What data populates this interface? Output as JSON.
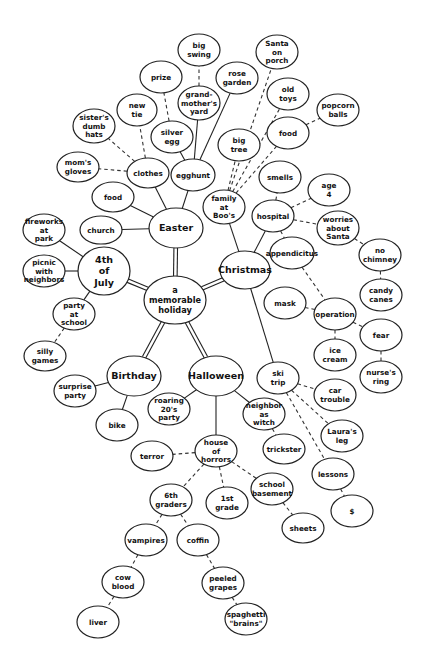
{
  "diagram": {
    "type": "mind map / cluster diagram",
    "central_topic": "a memorable holiday",
    "nodes": [
      {
        "id": "center",
        "label": [
          "a",
          "memorable",
          "holiday"
        ],
        "x": 175,
        "y": 300,
        "rx": 31,
        "ry": 24,
        "kind": "center"
      },
      {
        "id": "easter",
        "label": [
          "Easter"
        ],
        "x": 176,
        "y": 228,
        "rx": 27,
        "ry": 20,
        "kind": "major"
      },
      {
        "id": "christmas",
        "label": [
          "Christmas"
        ],
        "x": 245,
        "y": 270,
        "rx": 25,
        "ry": 19,
        "kind": "major"
      },
      {
        "id": "july4",
        "label": [
          "4th",
          "of",
          "July"
        ],
        "x": 104,
        "y": 271,
        "rx": 26,
        "ry": 24,
        "kind": "major"
      },
      {
        "id": "birthday",
        "label": [
          "Birthday"
        ],
        "x": 134,
        "y": 376,
        "rx": 27,
        "ry": 20,
        "kind": "major"
      },
      {
        "id": "halloween",
        "label": [
          "Halloween"
        ],
        "x": 216,
        "y": 376,
        "rx": 27,
        "ry": 20,
        "kind": "major"
      },
      {
        "id": "church",
        "label": [
          "church"
        ],
        "x": 101,
        "y": 230,
        "rx": 21,
        "ry": 14
      },
      {
        "id": "food_e",
        "label": [
          "food"
        ],
        "x": 113,
        "y": 197,
        "rx": 21,
        "ry": 15
      },
      {
        "id": "clothes",
        "label": [
          "clothes"
        ],
        "x": 148,
        "y": 173,
        "rx": 21,
        "ry": 15
      },
      {
        "id": "egghunt",
        "label": [
          "egghunt"
        ],
        "x": 193,
        "y": 175,
        "rx": 22,
        "ry": 16
      },
      {
        "id": "moms_gloves",
        "label": [
          "mom's",
          "gloves"
        ],
        "x": 78,
        "y": 167,
        "rx": 21,
        "ry": 15
      },
      {
        "id": "sisters_hats",
        "label": [
          "sister's",
          "dumb",
          "hats"
        ],
        "x": 94,
        "y": 126,
        "rx": 21,
        "ry": 17
      },
      {
        "id": "new_tie",
        "label": [
          "new",
          "tie"
        ],
        "x": 137,
        "y": 110,
        "rx": 20,
        "ry": 16
      },
      {
        "id": "prize",
        "label": [
          "prize"
        ],
        "x": 161,
        "y": 77,
        "rx": 21,
        "ry": 16
      },
      {
        "id": "silver_egg",
        "label": [
          "silver",
          "egg"
        ],
        "x": 172,
        "y": 137,
        "rx": 21,
        "ry": 16
      },
      {
        "id": "grandmothers_yard",
        "label": [
          "grand-",
          "mother's",
          "yard"
        ],
        "x": 199,
        "y": 103,
        "rx": 21,
        "ry": 17
      },
      {
        "id": "big_swing",
        "label": [
          "big",
          "swing"
        ],
        "x": 199,
        "y": 50,
        "rx": 21,
        "ry": 16
      },
      {
        "id": "rose_garden",
        "label": [
          "rose",
          "garden"
        ],
        "x": 237,
        "y": 78,
        "rx": 21,
        "ry": 16
      },
      {
        "id": "fireworks",
        "label": [
          "fireworks",
          "at",
          "park"
        ],
        "x": 44,
        "y": 230,
        "rx": 21,
        "ry": 16
      },
      {
        "id": "picnic",
        "label": [
          "picnic",
          "with",
          "neighbors"
        ],
        "x": 44,
        "y": 271,
        "rx": 21,
        "ry": 16
      },
      {
        "id": "party_school",
        "label": [
          "party",
          "at",
          "school"
        ],
        "x": 74,
        "y": 314,
        "rx": 21,
        "ry": 16
      },
      {
        "id": "silly_games",
        "label": [
          "silly",
          "games"
        ],
        "x": 45,
        "y": 356,
        "rx": 21,
        "ry": 15
      },
      {
        "id": "surprise_party",
        "label": [
          "surprise",
          "party"
        ],
        "x": 75,
        "y": 391,
        "rx": 21,
        "ry": 16
      },
      {
        "id": "bike",
        "label": [
          "bike"
        ],
        "x": 117,
        "y": 425,
        "rx": 21,
        "ry": 16
      },
      {
        "id": "roaring20s",
        "label": [
          "roaring",
          "20's",
          "party"
        ],
        "x": 169,
        "y": 409,
        "rx": 21,
        "ry": 16
      },
      {
        "id": "neighbor_witch",
        "label": [
          "neighbor",
          "as",
          "witch"
        ],
        "x": 264,
        "y": 414,
        "rx": 21,
        "ry": 16
      },
      {
        "id": "trickster",
        "label": [
          "trickster"
        ],
        "x": 284,
        "y": 449,
        "rx": 21,
        "ry": 15
      },
      {
        "id": "house_horrors",
        "label": [
          "house",
          "of",
          "horrors"
        ],
        "x": 216,
        "y": 451,
        "rx": 21,
        "ry": 16
      },
      {
        "id": "terror",
        "label": [
          "terror"
        ],
        "x": 152,
        "y": 456,
        "rx": 21,
        "ry": 15
      },
      {
        "id": "school_basement",
        "label": [
          "school",
          "basement"
        ],
        "x": 272,
        "y": 489,
        "rx": 21,
        "ry": 16
      },
      {
        "id": "sheets",
        "label": [
          "sheets"
        ],
        "x": 303,
        "y": 528,
        "rx": 21,
        "ry": 15
      },
      {
        "id": "first_grade",
        "label": [
          "1st",
          "grade"
        ],
        "x": 227,
        "y": 503,
        "rx": 21,
        "ry": 16
      },
      {
        "id": "sixth_graders",
        "label": [
          "6th",
          "graders"
        ],
        "x": 171,
        "y": 500,
        "rx": 21,
        "ry": 16
      },
      {
        "id": "vampires",
        "label": [
          "vampires"
        ],
        "x": 146,
        "y": 540,
        "rx": 21,
        "ry": 16
      },
      {
        "id": "coffin",
        "label": [
          "coffin"
        ],
        "x": 198,
        "y": 540,
        "rx": 21,
        "ry": 16
      },
      {
        "id": "cow_blood",
        "label": [
          "cow",
          "blood"
        ],
        "x": 123,
        "y": 582,
        "rx": 21,
        "ry": 16
      },
      {
        "id": "peeled_grapes",
        "label": [
          "peeled",
          "grapes"
        ],
        "x": 223,
        "y": 583,
        "rx": 21,
        "ry": 16
      },
      {
        "id": "liver",
        "label": [
          "liver"
        ],
        "x": 98,
        "y": 622,
        "rx": 21,
        "ry": 16
      },
      {
        "id": "spaghetti_brains",
        "label": [
          "spaghetti",
          "\"brains\""
        ],
        "x": 246,
        "y": 619,
        "rx": 21,
        "ry": 16
      },
      {
        "id": "family_boos",
        "label": [
          "family",
          "at",
          "Boo's"
        ],
        "x": 224,
        "y": 207,
        "rx": 21,
        "ry": 17
      },
      {
        "id": "big_tree",
        "label": [
          "big",
          "tree"
        ],
        "x": 239,
        "y": 145,
        "rx": 21,
        "ry": 16
      },
      {
        "id": "santa_porch",
        "label": [
          "Santa",
          "on",
          "porch"
        ],
        "x": 277,
        "y": 52,
        "rx": 21,
        "ry": 17
      },
      {
        "id": "old_toys",
        "label": [
          "old",
          "toys"
        ],
        "x": 288,
        "y": 94,
        "rx": 21,
        "ry": 16
      },
      {
        "id": "food_c",
        "label": [
          "food"
        ],
        "x": 288,
        "y": 133,
        "rx": 21,
        "ry": 16
      },
      {
        "id": "popcorn_balls",
        "label": [
          "popcorn",
          "balls"
        ],
        "x": 338,
        "y": 110,
        "rx": 21,
        "ry": 16
      },
      {
        "id": "smells",
        "label": [
          "smells"
        ],
        "x": 280,
        "y": 177,
        "rx": 21,
        "ry": 16
      },
      {
        "id": "hospital",
        "label": [
          "hospital"
        ],
        "x": 273,
        "y": 216,
        "rx": 21,
        "ry": 16
      },
      {
        "id": "age4",
        "label": [
          "age",
          "4"
        ],
        "x": 329,
        "y": 190,
        "rx": 21,
        "ry": 16
      },
      {
        "id": "worries_santa",
        "label": [
          "worries",
          "about",
          "Santa"
        ],
        "x": 338,
        "y": 228,
        "rx": 21,
        "ry": 17
      },
      {
        "id": "appendicitus",
        "label": [
          "appendicitus"
        ],
        "x": 292,
        "y": 253,
        "rx": 22,
        "ry": 16
      },
      {
        "id": "no_chimney",
        "label": [
          "no",
          "chimney"
        ],
        "x": 380,
        "y": 255,
        "rx": 21,
        "ry": 16
      },
      {
        "id": "candy_canes",
        "label": [
          "candy",
          "canes"
        ],
        "x": 381,
        "y": 295,
        "rx": 21,
        "ry": 16
      },
      {
        "id": "mask",
        "label": [
          "mask"
        ],
        "x": 285,
        "y": 303,
        "rx": 21,
        "ry": 16
      },
      {
        "id": "operation",
        "label": [
          "operation"
        ],
        "x": 335,
        "y": 314,
        "rx": 21,
        "ry": 16
      },
      {
        "id": "fear",
        "label": [
          "fear"
        ],
        "x": 381,
        "y": 335,
        "rx": 21,
        "ry": 16
      },
      {
        "id": "ice_cream",
        "label": [
          "ice",
          "cream"
        ],
        "x": 335,
        "y": 355,
        "rx": 21,
        "ry": 16
      },
      {
        "id": "nurses_ring",
        "label": [
          "nurse's",
          "ring"
        ],
        "x": 381,
        "y": 377,
        "rx": 21,
        "ry": 16
      },
      {
        "id": "ski_trip",
        "label": [
          "ski",
          "trip"
        ],
        "x": 278,
        "y": 378,
        "rx": 21,
        "ry": 16
      },
      {
        "id": "car_trouble",
        "label": [
          "car",
          "trouble"
        ],
        "x": 335,
        "y": 395,
        "rx": 21,
        "ry": 16
      },
      {
        "id": "lauras_leg",
        "label": [
          "Laura's",
          "leg"
        ],
        "x": 342,
        "y": 436,
        "rx": 21,
        "ry": 16
      },
      {
        "id": "lessons",
        "label": [
          "lessons"
        ],
        "x": 333,
        "y": 474,
        "rx": 21,
        "ry": 16
      },
      {
        "id": "dollar",
        "label": [
          "$"
        ],
        "x": 352,
        "y": 511,
        "rx": 21,
        "ry": 16
      }
    ],
    "edges": [
      {
        "from": "center",
        "to": "easter",
        "style": "double"
      },
      {
        "from": "center",
        "to": "christmas",
        "style": "double"
      },
      {
        "from": "center",
        "to": "july4",
        "style": "double"
      },
      {
        "from": "center",
        "to": "birthday",
        "style": "double"
      },
      {
        "from": "center",
        "to": "halloween",
        "style": "double"
      },
      {
        "from": "easter",
        "to": "church",
        "style": "solid"
      },
      {
        "from": "easter",
        "to": "food_e",
        "style": "solid"
      },
      {
        "from": "easter",
        "to": "clothes",
        "style": "solid"
      },
      {
        "from": "easter",
        "to": "egghunt",
        "style": "solid"
      },
      {
        "from": "clothes",
        "to": "moms_gloves",
        "style": "dashed"
      },
      {
        "from": "clothes",
        "to": "sisters_hats",
        "style": "dashed"
      },
      {
        "from": "clothes",
        "to": "new_tie",
        "style": "dashed"
      },
      {
        "from": "egghunt",
        "to": "silver_egg",
        "style": "solid"
      },
      {
        "from": "silver_egg",
        "to": "prize",
        "style": "dashed"
      },
      {
        "from": "egghunt",
        "to": "grandmothers_yard",
        "style": "solid"
      },
      {
        "from": "grandmothers_yard",
        "to": "big_swing",
        "style": "dashed"
      },
      {
        "from": "egghunt",
        "to": "rose_garden",
        "style": "solid"
      },
      {
        "from": "july4",
        "to": "fireworks",
        "style": "solid"
      },
      {
        "from": "july4",
        "to": "picnic",
        "style": "solid"
      },
      {
        "from": "july4",
        "to": "party_school",
        "style": "solid"
      },
      {
        "from": "party_school",
        "to": "silly_games",
        "style": "dashed"
      },
      {
        "from": "birthday",
        "to": "surprise_party",
        "style": "solid"
      },
      {
        "from": "birthday",
        "to": "bike",
        "style": "solid"
      },
      {
        "from": "halloween",
        "to": "roaring20s",
        "style": "solid"
      },
      {
        "from": "halloween",
        "to": "neighbor_witch",
        "style": "solid"
      },
      {
        "from": "neighbor_witch",
        "to": "trickster",
        "style": "dashed"
      },
      {
        "from": "halloween",
        "to": "house_horrors",
        "style": "solid"
      },
      {
        "from": "house_horrors",
        "to": "terror",
        "style": "dashed"
      },
      {
        "from": "house_horrors",
        "to": "school_basement",
        "style": "dashed"
      },
      {
        "from": "school_basement",
        "to": "sheets",
        "style": "dashed"
      },
      {
        "from": "house_horrors",
        "to": "first_grade",
        "style": "dashed"
      },
      {
        "from": "house_horrors",
        "to": "sixth_graders",
        "style": "dashed"
      },
      {
        "from": "sixth_graders",
        "to": "vampires",
        "style": "dashed"
      },
      {
        "from": "sixth_graders",
        "to": "coffin",
        "style": "dashed"
      },
      {
        "from": "vampires",
        "to": "cow_blood",
        "style": "dashed"
      },
      {
        "from": "cow_blood",
        "to": "liver",
        "style": "dashed"
      },
      {
        "from": "coffin",
        "to": "peeled_grapes",
        "style": "dashed"
      },
      {
        "from": "peeled_grapes",
        "to": "spaghetti_brains",
        "style": "dashed"
      },
      {
        "from": "christmas",
        "to": "family_boos",
        "style": "solid"
      },
      {
        "from": "family_boos",
        "to": "big_tree",
        "style": "dashed"
      },
      {
        "from": "family_boos",
        "to": "santa_porch",
        "style": "dashed"
      },
      {
        "from": "family_boos",
        "to": "old_toys",
        "style": "dashed"
      },
      {
        "from": "family_boos",
        "to": "food_c",
        "style": "dashed"
      },
      {
        "from": "food_c",
        "to": "popcorn_balls",
        "style": "dashed"
      },
      {
        "from": "christmas",
        "to": "hospital",
        "style": "solid"
      },
      {
        "from": "hospital",
        "to": "smells",
        "style": "dashed"
      },
      {
        "from": "hospital",
        "to": "age4",
        "style": "dashed"
      },
      {
        "from": "hospital",
        "to": "worries_santa",
        "style": "dashed"
      },
      {
        "from": "worries_santa",
        "to": "no_chimney",
        "style": "dashed"
      },
      {
        "from": "no_chimney",
        "to": "candy_canes",
        "style": "dashed"
      },
      {
        "from": "hospital",
        "to": "appendicitus",
        "style": "dashed"
      },
      {
        "from": "appendicitus",
        "to": "operation",
        "style": "dashed"
      },
      {
        "from": "operation",
        "to": "mask",
        "style": "dashed"
      },
      {
        "from": "operation",
        "to": "ice_cream",
        "style": "dashed"
      },
      {
        "from": "operation",
        "to": "fear",
        "style": "dashed"
      },
      {
        "from": "fear",
        "to": "nurses_ring",
        "style": "dashed"
      },
      {
        "from": "christmas",
        "to": "ski_trip",
        "style": "solid"
      },
      {
        "from": "ski_trip",
        "to": "car_trouble",
        "style": "dashed"
      },
      {
        "from": "ski_trip",
        "to": "lauras_leg",
        "style": "dashed"
      },
      {
        "from": "ski_trip",
        "to": "lessons",
        "style": "dashed"
      },
      {
        "from": "lessons",
        "to": "dollar",
        "style": "dashed"
      }
    ]
  }
}
